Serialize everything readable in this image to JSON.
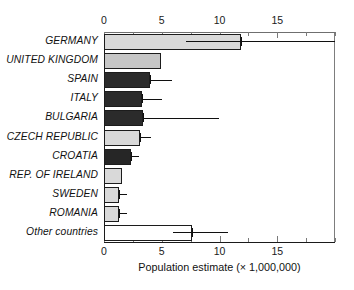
{
  "chart_data": {
    "type": "bar",
    "orientation": "horizontal",
    "title": "",
    "xlabel": "Population estimate (× 1,000,000)",
    "ylabel": "",
    "xlim": [
      0,
      20
    ],
    "xticks": [
      0,
      5,
      10,
      15
    ],
    "xtick_labels": [
      "0",
      "5",
      "10",
      "15"
    ],
    "minor_tick_interval": 2.5,
    "grid": false,
    "legend": null,
    "axis_top": true,
    "axis_bottom": true,
    "categories": [
      "GERMANY",
      "UNITED KINGDOM",
      "SPAIN",
      "ITALY",
      "BULGARIA",
      "CZECH REPUBLIC",
      "CROATIA",
      "REP. OF IRELAND",
      "SWEDEN",
      "ROMANIA",
      "Other countries"
    ],
    "values": [
      11.9,
      4.9,
      4.0,
      3.3,
      3.4,
      3.1,
      2.3,
      1.6,
      1.3,
      1.3,
      7.6
    ],
    "error_low": [
      7.1,
      null,
      4.0,
      3.3,
      3.4,
      3.1,
      2.3,
      null,
      1.3,
      1.3,
      6.0
    ],
    "error_high": [
      20.0,
      null,
      5.9,
      5.0,
      10.0,
      4.1,
      3.0,
      null,
      2.0,
      2.0,
      10.7
    ],
    "bar_fills": [
      "#d9d9d9",
      "#c6c6c6",
      "#2b2b2b",
      "#2b2b2b",
      "#2b2b2b",
      "#d9d9d9",
      "#262626",
      "#d9d9d9",
      "#d9d9d9",
      "#d9d9d9",
      "#ffffff"
    ],
    "bar_edge_color": "#1c1c1c",
    "error_color": "#101010",
    "axis_color": "#1a1a1a",
    "background": "#ffffff"
  }
}
